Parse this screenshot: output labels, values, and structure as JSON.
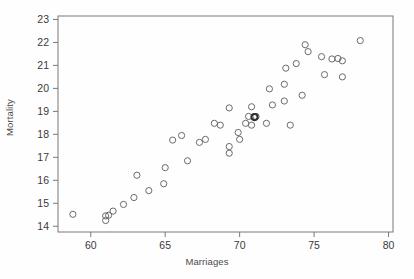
{
  "chart_data": {
    "type": "scatter",
    "title": "",
    "xlabel": "Marriages",
    "ylabel": "Mortality",
    "xlim": [
      57.8,
      80.3
    ],
    "ylim": [
      13.75,
      23.15
    ],
    "xticks": [
      60,
      65,
      70,
      75,
      80
    ],
    "yticks": [
      14,
      15,
      16,
      17,
      18,
      19,
      20,
      21,
      22,
      23
    ],
    "grid": false,
    "legend": null,
    "marker": {
      "style": "open-circle",
      "radius_px": 3.1,
      "stroke": "#6b6b6b",
      "fill": "none"
    },
    "points": [
      {
        "x": 58.8,
        "y": 14.52
      },
      {
        "x": 61.0,
        "y": 14.45
      },
      {
        "x": 61.0,
        "y": 14.25
      },
      {
        "x": 61.2,
        "y": 14.48
      },
      {
        "x": 61.5,
        "y": 14.66
      },
      {
        "x": 62.2,
        "y": 14.95
      },
      {
        "x": 62.9,
        "y": 15.25
      },
      {
        "x": 63.1,
        "y": 16.22
      },
      {
        "x": 63.9,
        "y": 15.55
      },
      {
        "x": 64.9,
        "y": 15.85
      },
      {
        "x": 65.0,
        "y": 16.55
      },
      {
        "x": 65.5,
        "y": 17.75
      },
      {
        "x": 66.1,
        "y": 17.95
      },
      {
        "x": 66.5,
        "y": 16.85
      },
      {
        "x": 67.3,
        "y": 17.65
      },
      {
        "x": 67.7,
        "y": 17.78
      },
      {
        "x": 68.3,
        "y": 18.48
      },
      {
        "x": 68.7,
        "y": 18.4
      },
      {
        "x": 69.3,
        "y": 19.15
      },
      {
        "x": 69.3,
        "y": 17.47
      },
      {
        "x": 69.3,
        "y": 17.18
      },
      {
        "x": 69.9,
        "y": 18.08
      },
      {
        "x": 70.0,
        "y": 17.78
      },
      {
        "x": 70.4,
        "y": 18.48
      },
      {
        "x": 70.6,
        "y": 18.78
      },
      {
        "x": 70.8,
        "y": 19.2
      },
      {
        "x": 70.8,
        "y": 18.4
      },
      {
        "x": 71.0,
        "y": 18.75
      },
      {
        "x": 71.1,
        "y": 18.78
      },
      {
        "x": 71.8,
        "y": 18.48
      },
      {
        "x": 72.0,
        "y": 19.98
      },
      {
        "x": 72.2,
        "y": 19.28
      },
      {
        "x": 73.0,
        "y": 20.18
      },
      {
        "x": 73.0,
        "y": 19.45
      },
      {
        "x": 73.1,
        "y": 20.88
      },
      {
        "x": 73.4,
        "y": 18.4
      },
      {
        "x": 73.8,
        "y": 21.08
      },
      {
        "x": 74.2,
        "y": 19.7
      },
      {
        "x": 74.4,
        "y": 21.9
      },
      {
        "x": 74.6,
        "y": 21.6
      },
      {
        "x": 75.5,
        "y": 21.38
      },
      {
        "x": 75.7,
        "y": 20.6
      },
      {
        "x": 76.2,
        "y": 21.28
      },
      {
        "x": 76.6,
        "y": 21.3
      },
      {
        "x": 76.9,
        "y": 21.2
      },
      {
        "x": 76.9,
        "y": 20.5
      },
      {
        "x": 78.1,
        "y": 22.08
      }
    ],
    "emphasized_points": [
      {
        "x": 71.0,
        "y": 18.75,
        "note": "overlapping-markers-dark"
      }
    ]
  },
  "axes": {
    "frame_color": "#787878",
    "tick_color": "#787878",
    "tick_label_color": "#3a3a3a",
    "background": "#ffffff"
  }
}
